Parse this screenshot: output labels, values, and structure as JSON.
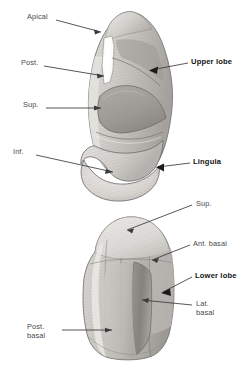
{
  "figure": {
    "background_color": "#ffffff",
    "width": 251,
    "height": 373
  },
  "labels": {
    "apical": "Apical",
    "post": "Post.",
    "sup_upper": "Sup.",
    "inf": "Inf.",
    "upper_lobe": "Upper lobe",
    "lingula": "Lingula",
    "sup_lower": "Sup.",
    "ant_basal": "Ant. basal",
    "lower_lobe": "Lower lobe",
    "lat_basal": "Lat.\nbasal",
    "post_basal": "Post.\nbasal"
  },
  "colors": {
    "label_plain": "#4a4a4a",
    "label_bold": "#141414",
    "leader_line": "#3a3a3a",
    "outline": "#6f6f6f",
    "tissue_light": "#e2e0dd",
    "tissue_mid": "#c9c6c2",
    "tissue_dark": "#a8a5a1",
    "tissue_darkest": "#8e8b87",
    "highlight": "#f2f1ef"
  },
  "structures": {
    "upper_lobe": {
      "name": "Upper lobe",
      "segments": [
        "Apical",
        "Post.",
        "Sup.",
        "Inf."
      ],
      "sublobe": "Lingula"
    },
    "lower_lobe": {
      "name": "Lower lobe",
      "segments": [
        "Sup.",
        "Ant. basal",
        "Lat. basal",
        "Post. basal"
      ]
    }
  }
}
